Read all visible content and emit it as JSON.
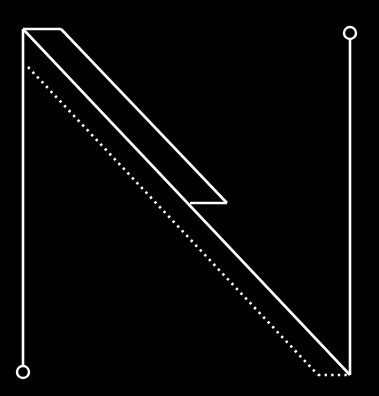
{
  "diagram": {
    "background": "#000000",
    "stroke_color": "#ffffff",
    "shapes": {
      "left_stem": {
        "x": 23,
        "y1": 29,
        "y2": 366
      },
      "top_bar": {
        "x1": 23,
        "x2": 61,
        "y": 29
      },
      "outer_diagonal": {
        "x1": 61,
        "y1": 29,
        "x2": 227,
        "y2": 203
      },
      "notch": {
        "x1": 227,
        "x2": 190,
        "y": 203
      },
      "inner_diagonal": {
        "x1": 23,
        "y1": 29,
        "x2": 350,
        "y2": 375
      },
      "right_stem": {
        "x": 350,
        "y1": 39,
        "y2": 375
      },
      "dotted_diagonal": {
        "x1": 28,
        "y1": 67,
        "x2": 318,
        "y2": 375
      },
      "dotted_base": {
        "x1": 318,
        "x2": 350,
        "y": 375
      }
    },
    "nodes": [
      {
        "name": "bottom-left-node",
        "cx": 23,
        "cy": 372,
        "r": 6
      },
      {
        "name": "top-right-node",
        "cx": 350,
        "cy": 33,
        "r": 6
      }
    ]
  }
}
